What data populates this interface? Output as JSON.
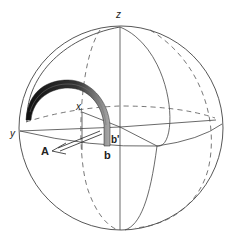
{
  "figure": {
    "colors": {
      "line": "#444444",
      "band_dark": "#1a1a1a",
      "band_light": "#9a9a9a",
      "background": "#ffffff"
    },
    "labels": {
      "z": "z",
      "x": "x",
      "y": "y",
      "A": "A",
      "b_prime": "b'",
      "b": "b"
    }
  }
}
